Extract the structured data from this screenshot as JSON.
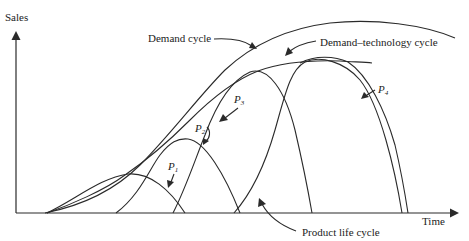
{
  "diagram": {
    "type": "line",
    "axes": {
      "y_label": "Sales",
      "x_label": "Time"
    },
    "labels": {
      "demand_cycle": "Demand cycle",
      "demand_technology_cycle": "Demand–technology cycle",
      "product_life_cycle": "Product life cycle",
      "p1_main": "P",
      "p1_sub": "1",
      "p2_main": "P",
      "p2_sub": "2",
      "p3_main": "P",
      "p3_sub": "3",
      "p4_main": "P",
      "p4_sub": "4"
    },
    "curves": [
      {
        "name": "Demand cycle",
        "description": "Outer S-shaped envelope rising from origin and flattening at top right"
      },
      {
        "name": "Demand–technology cycle",
        "description": "Envelope tangent to successive product life cycle peaks"
      },
      {
        "name": "P1",
        "description": "First product life cycle, smallest hump"
      },
      {
        "name": "P2",
        "description": "Second product life cycle"
      },
      {
        "name": "P3",
        "description": "Third product life cycle"
      },
      {
        "name": "P4",
        "description": "Fourth product life cycle, largest hump (double line)"
      }
    ],
    "colors": {
      "ink": "#2a2a2a",
      "background": "#ffffff"
    }
  }
}
